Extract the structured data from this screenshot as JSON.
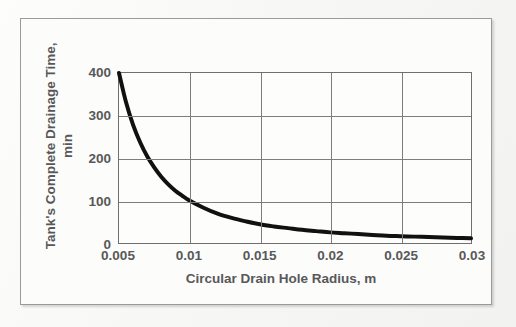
{
  "chart_data": {
    "type": "line",
    "title": "",
    "xlabel": "Circular Drain Hole Radius, m",
    "ylabel_line1": "Tank's Complete Drainage Time,",
    "ylabel_line2": "min",
    "xlim": [
      0.005,
      0.03
    ],
    "ylim": [
      0,
      400
    ],
    "xticks": [
      "0.005",
      "0.01",
      "0.015",
      "0.02",
      "0.025",
      "0.03"
    ],
    "xtick_values": [
      0.005,
      0.01,
      0.015,
      0.02,
      0.025,
      0.03
    ],
    "yticks": [
      "0",
      "100",
      "200",
      "300",
      "400"
    ],
    "ytick_values": [
      0,
      100,
      200,
      300,
      400
    ],
    "grid": true,
    "legend": "none",
    "series": [
      {
        "name": "Drainage time",
        "color": "#111111",
        "linewidth": 4,
        "x": [
          0.005,
          0.0055,
          0.006,
          0.0065,
          0.007,
          0.0075,
          0.008,
          0.0085,
          0.009,
          0.0095,
          0.01,
          0.011,
          0.012,
          0.013,
          0.014,
          0.015,
          0.016,
          0.017,
          0.018,
          0.019,
          0.02,
          0.021,
          0.022,
          0.023,
          0.024,
          0.025,
          0.026,
          0.027,
          0.028,
          0.029,
          0.03
        ],
        "y": [
          400,
          331,
          278,
          237,
          204,
          178,
          156,
          138,
          123,
          111,
          100,
          83,
          69,
          59,
          51,
          44,
          39,
          35,
          31,
          28,
          25,
          23,
          21,
          19,
          17,
          16,
          15,
          14,
          13,
          12,
          11
        ]
      }
    ],
    "colors": {
      "curve": "#111111",
      "grid": "#7d7d7d",
      "axis": "#6f6f6f",
      "text": "#58585a",
      "frame": "#9a9a9a",
      "background": "#fcfcfb"
    }
  }
}
